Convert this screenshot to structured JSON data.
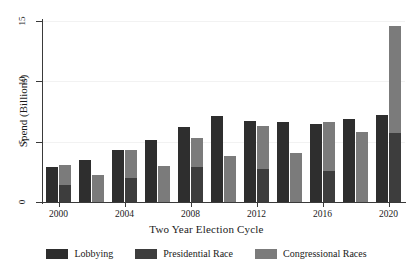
{
  "chart_data": {
    "type": "bar",
    "title": "",
    "xlabel": "Two Year Election Cycle",
    "ylabel": "Spend (Billions)",
    "ylim": [
      0,
      15
    ],
    "yticks": [
      0,
      5,
      10,
      15
    ],
    "ytick_labels": [
      "0",
      "5",
      "10",
      "15"
    ],
    "xtick_labels": [
      "2000",
      "2004",
      "2008",
      "2012",
      "2016",
      "2020"
    ],
    "grid": true,
    "legend_position": "bottom",
    "bar_style": "grouped-with-stacked-second-bar",
    "categories": [
      "2000",
      "2002",
      "2004",
      "2006",
      "2008",
      "2010",
      "2012",
      "2014",
      "2016",
      "2018",
      "2020"
    ],
    "series": [
      {
        "name": "Lobbying",
        "color": "#2e2e2e",
        "stack": "a",
        "values": [
          2.9,
          3.5,
          4.3,
          5.1,
          6.2,
          7.1,
          6.7,
          6.6,
          6.45,
          6.9,
          7.2
        ]
      },
      {
        "name": "Presidential Race",
        "color": "#3d3d3d",
        "stack": "b",
        "values": [
          1.4,
          0.0,
          2.0,
          0.0,
          2.9,
          0.0,
          2.75,
          0.0,
          2.55,
          0.0,
          5.7
        ]
      },
      {
        "name": "Congressional Races",
        "color": "#7b7b7b",
        "stack": "b",
        "values": [
          1.7,
          2.25,
          2.3,
          2.95,
          2.4,
          3.8,
          3.55,
          4.05,
          4.1,
          5.8,
          8.9
        ]
      }
    ],
    "stacked_bar_totals": [
      3.1,
      2.25,
      4.3,
      2.95,
      5.3,
      3.8,
      6.3,
      4.05,
      6.65,
      5.8,
      14.6
    ]
  },
  "legend": {
    "items": [
      {
        "label": "Lobbying",
        "color": "#2e2e2e"
      },
      {
        "label": "Presidential Race",
        "color": "#3d3d3d"
      },
      {
        "label": "Congressional Races",
        "color": "#7b7b7b"
      }
    ]
  },
  "axes": {
    "x_title": "Two Year Election Cycle",
    "y_title": "Spend (Billions)"
  }
}
